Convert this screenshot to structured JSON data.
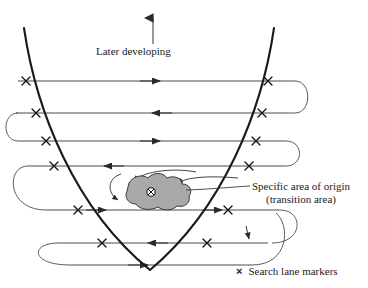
{
  "figure": {
    "type": "search-pattern-diagram",
    "title_label": "Later developing",
    "origin_label_line1": "Specific area of origin",
    "origin_label_line2": "(transition area)",
    "legend_marker_glyph": "×",
    "legend_text": "Search lane markers",
    "origin_center_glyph": "⊗",
    "colors": {
      "background": "#ffffff",
      "parabola": "#1a1a1a",
      "lane": "#4a4a4a",
      "blob_fill": "#a9a9a9",
      "blob_stroke": "#333333",
      "text": "#1a1a1a"
    },
    "direction_arrow": {
      "name": "later-developing-arrow",
      "points": "up"
    },
    "lanes": [
      {
        "y": 81,
        "direction": "right",
        "x_start": 18,
        "x_end": 295
      },
      {
        "y": 113,
        "direction": "left",
        "x_start": 16,
        "x_end": 288
      },
      {
        "y": 141,
        "direction": "right",
        "x_start": 18,
        "x_end": 286
      },
      {
        "y": 166,
        "direction": "left",
        "x_start": 28,
        "x_end": 283
      },
      {
        "y": 210,
        "direction": "right",
        "x_start": 46,
        "x_end": 280
      },
      {
        "y": 243,
        "direction": "left",
        "x_start": 58,
        "x_end": 268
      },
      {
        "y": 265,
        "direction": "right",
        "x_start": 70,
        "x_end": 252
      }
    ],
    "lane_markers": [
      {
        "x": 26,
        "y": 81
      },
      {
        "x": 268,
        "y": 81
      },
      {
        "x": 36,
        "y": 113
      },
      {
        "x": 262,
        "y": 113
      },
      {
        "x": 46,
        "y": 141
      },
      {
        "x": 256,
        "y": 141
      },
      {
        "x": 54,
        "y": 166
      },
      {
        "x": 249,
        "y": 166
      },
      {
        "x": 78,
        "y": 210
      },
      {
        "x": 228,
        "y": 210
      },
      {
        "x": 102,
        "y": 243
      },
      {
        "x": 207,
        "y": 243
      }
    ],
    "origin_area": {
      "center_x": 151,
      "center_y": 192
    }
  }
}
